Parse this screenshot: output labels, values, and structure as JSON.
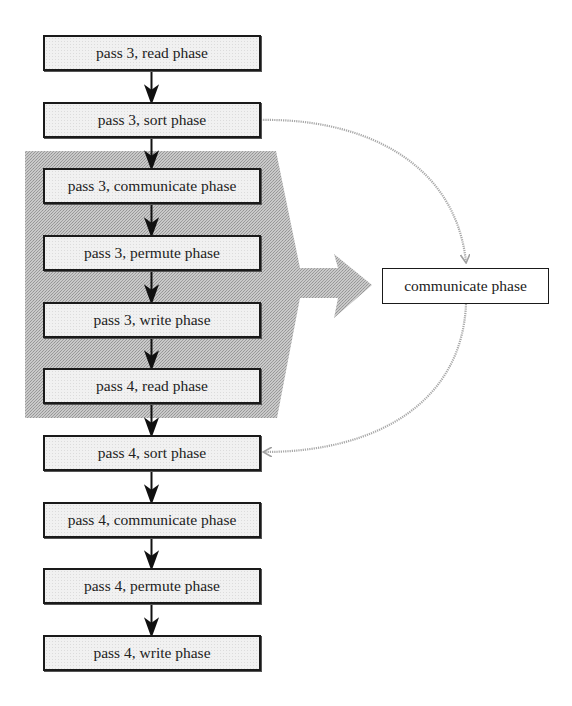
{
  "diagram": {
    "main_flow": [
      {
        "label": "pass 3, read phase",
        "highlighted": false
      },
      {
        "label": "pass 3, sort phase",
        "highlighted": false
      },
      {
        "label": "pass 3, communicate phase",
        "highlighted": true
      },
      {
        "label": "pass 3, permute phase",
        "highlighted": true
      },
      {
        "label": "pass 3, write phase",
        "highlighted": true
      },
      {
        "label": "pass 4, read phase",
        "highlighted": true
      },
      {
        "label": "pass 4, sort phase",
        "highlighted": false
      },
      {
        "label": "pass 4, communicate phase",
        "highlighted": false
      },
      {
        "label": "pass 4, permute phase",
        "highlighted": false
      },
      {
        "label": "pass 4, write phase",
        "highlighted": false
      }
    ],
    "side_node": {
      "label": "communicate phase"
    },
    "edges": [
      {
        "from": "pass 3, read phase",
        "to": "pass 3, sort phase",
        "style": "solid"
      },
      {
        "from": "pass 3, sort phase",
        "to": "pass 3, communicate phase",
        "style": "solid"
      },
      {
        "from": "pass 3, communicate phase",
        "to": "pass 3, permute phase",
        "style": "solid"
      },
      {
        "from": "pass 3, permute phase",
        "to": "pass 3, write phase",
        "style": "solid"
      },
      {
        "from": "pass 3, write phase",
        "to": "pass 4, read phase",
        "style": "solid"
      },
      {
        "from": "pass 4, read phase",
        "to": "pass 4, sort phase",
        "style": "solid"
      },
      {
        "from": "pass 4, sort phase",
        "to": "pass 4, communicate phase",
        "style": "solid"
      },
      {
        "from": "pass 4, communicate phase",
        "to": "pass 4, permute phase",
        "style": "solid"
      },
      {
        "from": "pass 4, permute phase",
        "to": "pass 4, write phase",
        "style": "solid"
      },
      {
        "from": "pass 3, sort phase",
        "to": "communicate phase",
        "style": "gray-curved"
      },
      {
        "from": "communicate phase",
        "to": "pass 4, sort phase",
        "style": "gray-curved"
      }
    ],
    "highlight_region": {
      "shape": "block-arrow-right",
      "points_to": "communicate phase",
      "color": "#b4b4b4"
    },
    "colors": {
      "box_border": "#1a1a1a",
      "box_fill": "#f1f1f1",
      "curve": "#a8a8a8",
      "shade": "#b4b4b4"
    }
  }
}
